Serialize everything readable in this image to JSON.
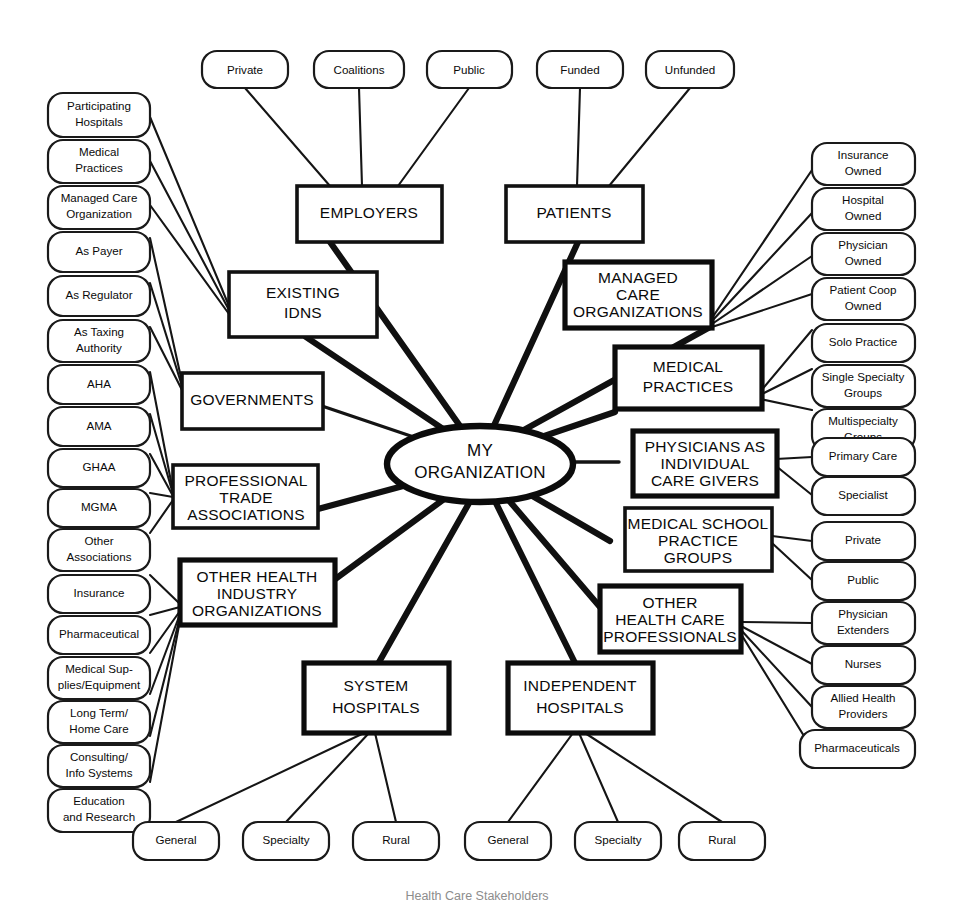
{
  "diagram": {
    "title": "Health Care Stakeholders",
    "center": {
      "id": "my-organization",
      "label_lines": [
        "MY",
        "ORGANIZATION"
      ],
      "shape": "ellipse"
    },
    "primary_nodes": [
      {
        "id": "employers",
        "label_lines": [
          "EMPLOYERS"
        ]
      },
      {
        "id": "patients",
        "label_lines": [
          "PATIENTS"
        ]
      },
      {
        "id": "existing-idns",
        "label_lines": [
          "EXISTING",
          "IDNS"
        ]
      },
      {
        "id": "managed-care-organizations",
        "label_lines": [
          "MANAGED",
          "CARE",
          "ORGANIZATIONS"
        ]
      },
      {
        "id": "governments",
        "label_lines": [
          "GOVERNMENTS"
        ]
      },
      {
        "id": "medical-practices",
        "label_lines": [
          "MEDICAL",
          "PRACTICES"
        ]
      },
      {
        "id": "physicians-as-individual-care-givers",
        "label_lines": [
          "PHYSICIANS AS",
          "INDIVIDUAL",
          "CARE GIVERS"
        ]
      },
      {
        "id": "professional-trade-associations",
        "label_lines": [
          "PROFESSIONAL",
          "TRADE",
          "ASSOCIATIONS"
        ]
      },
      {
        "id": "medical-school-practice-groups",
        "label_lines": [
          "MEDICAL SCHOOL",
          "PRACTICE",
          "GROUPS"
        ]
      },
      {
        "id": "other-health-industry-organizations",
        "label_lines": [
          "OTHER HEALTH",
          "INDUSTRY",
          "ORGANIZATIONS"
        ]
      },
      {
        "id": "other-health-care-professionals",
        "label_lines": [
          "OTHER",
          "HEALTH CARE",
          "PROFESSIONALS"
        ]
      },
      {
        "id": "system-hospitals",
        "label_lines": [
          "SYSTEM",
          "HOSPITALS"
        ]
      },
      {
        "id": "independent-hospitals",
        "label_lines": [
          "INDEPENDENT",
          "HOSPITALS"
        ]
      }
    ],
    "leaf_nodes": {
      "top_row": [
        {
          "id": "private-top",
          "label_lines": [
            "Private"
          ]
        },
        {
          "id": "coalitions",
          "label_lines": [
            "Coalitions"
          ]
        },
        {
          "id": "public-top",
          "label_lines": [
            "Public"
          ]
        },
        {
          "id": "funded",
          "label_lines": [
            "Funded"
          ]
        },
        {
          "id": "unfunded",
          "label_lines": [
            "Unfunded"
          ]
        }
      ],
      "left_column": [
        {
          "id": "participating-hospitals",
          "label_lines": [
            "Participating",
            "Hospitals"
          ]
        },
        {
          "id": "medical-practices-leaf",
          "label_lines": [
            "Medical",
            "Practices"
          ]
        },
        {
          "id": "managed-care-organization-leaf",
          "label_lines": [
            "Managed Care",
            "Organization"
          ]
        },
        {
          "id": "as-payer",
          "label_lines": [
            "As Payer"
          ]
        },
        {
          "id": "as-regulator",
          "label_lines": [
            "As Regulator"
          ]
        },
        {
          "id": "as-taxing-authority",
          "label_lines": [
            "As Taxing",
            "Authority"
          ]
        },
        {
          "id": "aha",
          "label_lines": [
            "AHA"
          ]
        },
        {
          "id": "ama",
          "label_lines": [
            "AMA"
          ]
        },
        {
          "id": "ghaa",
          "label_lines": [
            "GHAA"
          ]
        },
        {
          "id": "mgma",
          "label_lines": [
            "MGMA"
          ]
        },
        {
          "id": "other-associations",
          "label_lines": [
            "Other",
            "Associations"
          ]
        },
        {
          "id": "insurance",
          "label_lines": [
            "Insurance"
          ]
        },
        {
          "id": "pharmaceutical",
          "label_lines": [
            "Pharmaceutical"
          ]
        },
        {
          "id": "medical-supplies-equipment",
          "label_lines": [
            "Medical Sup-",
            "plies/Equipment"
          ]
        },
        {
          "id": "long-term-home-care",
          "label_lines": [
            "Long Term/",
            "Home Care"
          ]
        },
        {
          "id": "consulting-info-systems",
          "label_lines": [
            "Consulting/",
            "Info Systems"
          ]
        },
        {
          "id": "education-and-research",
          "label_lines": [
            "Education",
            "and Research"
          ]
        }
      ],
      "right_column": [
        {
          "id": "insurance-owned",
          "label_lines": [
            "Insurance",
            "Owned"
          ]
        },
        {
          "id": "hospital-owned",
          "label_lines": [
            "Hospital",
            "Owned"
          ]
        },
        {
          "id": "physician-owned",
          "label_lines": [
            "Physician",
            "Owned"
          ]
        },
        {
          "id": "patient-coop-owned",
          "label_lines": [
            "Patient Coop",
            "Owned"
          ]
        },
        {
          "id": "solo-practice",
          "label_lines": [
            "Solo Practice"
          ]
        },
        {
          "id": "single-specialty-groups",
          "label_lines": [
            "Single Specialty",
            "Groups"
          ]
        },
        {
          "id": "multispecialty-groups",
          "label_lines": [
            "Multispecialty",
            "Groups"
          ]
        },
        {
          "id": "primary-care",
          "label_lines": [
            "Primary Care"
          ]
        },
        {
          "id": "specialist",
          "label_lines": [
            "Specialist"
          ]
        },
        {
          "id": "private-right",
          "label_lines": [
            "Private"
          ]
        },
        {
          "id": "public-right",
          "label_lines": [
            "Public"
          ]
        },
        {
          "id": "physician-extenders",
          "label_lines": [
            "Physician",
            "Extenders"
          ]
        },
        {
          "id": "nurses",
          "label_lines": [
            "Nurses"
          ]
        },
        {
          "id": "allied-health-providers",
          "label_lines": [
            "Allied Health",
            "Providers"
          ]
        },
        {
          "id": "pharmaceuticals",
          "label_lines": [
            "Pharmaceuticals"
          ]
        }
      ],
      "bottom_row": [
        {
          "id": "general-system",
          "label_lines": [
            "General"
          ]
        },
        {
          "id": "specialty-system",
          "label_lines": [
            "Specialty"
          ]
        },
        {
          "id": "rural-system",
          "label_lines": [
            "Rural"
          ]
        },
        {
          "id": "general-independent",
          "label_lines": [
            "General"
          ]
        },
        {
          "id": "specialty-independent",
          "label_lines": [
            "Specialty"
          ]
        },
        {
          "id": "rural-independent",
          "label_lines": [
            "Rural"
          ]
        }
      ]
    },
    "colors": {
      "ink": "#0a0a0a",
      "background": "#ffffff",
      "caption": "#8d8d8d"
    }
  }
}
